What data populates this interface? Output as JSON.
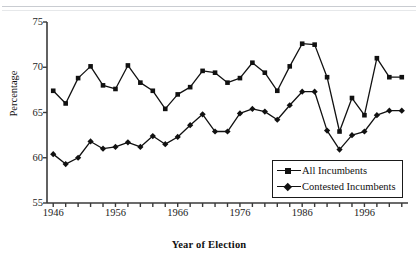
{
  "figure": {
    "background": "#ffffff",
    "line_color": "#111111",
    "axis_color": "#333333"
  },
  "chart_data": {
    "type": "line",
    "title": "",
    "xlabel": "Year of Election",
    "ylabel": "Percentage",
    "xlim": [
      1945,
      2003
    ],
    "ylim": [
      55,
      75
    ],
    "yticks": [
      55,
      60,
      65,
      70,
      75
    ],
    "xticks": [
      1946,
      1956,
      1966,
      1976,
      1986,
      1996
    ],
    "xtick_labels": [
      "1946",
      "1956",
      "1966",
      "1976",
      "1986",
      "1996"
    ],
    "ytick_labels": [
      "55",
      "60",
      "65",
      "70",
      "75"
    ],
    "xminor_tick_step": 2,
    "grid": false,
    "legend_position": "lower right",
    "x": [
      1946,
      1948,
      1950,
      1952,
      1954,
      1956,
      1958,
      1960,
      1962,
      1964,
      1966,
      1968,
      1970,
      1972,
      1974,
      1976,
      1978,
      1980,
      1982,
      1984,
      1986,
      1988,
      1990,
      1992,
      1994,
      1996,
      1998,
      2000,
      2002
    ],
    "series": [
      {
        "name": "All Incumbents",
        "marker": "square",
        "values": [
          67.4,
          66.0,
          68.8,
          70.1,
          68.0,
          67.6,
          70.2,
          68.3,
          67.4,
          65.4,
          67.0,
          67.8,
          69.6,
          69.4,
          68.3,
          68.8,
          70.5,
          69.4,
          67.4,
          70.1,
          72.6,
          72.5,
          68.9,
          62.9,
          66.6,
          64.7,
          71.0,
          68.9,
          68.9
        ]
      },
      {
        "name": "Contested Incumbents",
        "marker": "diamond",
        "values": [
          60.4,
          59.3,
          60.0,
          61.8,
          61.0,
          61.2,
          61.7,
          61.2,
          62.4,
          61.5,
          62.3,
          63.6,
          64.8,
          62.9,
          62.9,
          64.9,
          65.4,
          65.1,
          64.2,
          65.8,
          67.3,
          67.3,
          63.0,
          60.9,
          62.5,
          62.9,
          64.7,
          65.2,
          65.2
        ]
      }
    ]
  },
  "legend": {
    "items": [
      {
        "label": "All Incumbents",
        "marker": "square"
      },
      {
        "label": "Contested Incumbents",
        "marker": "diamond"
      }
    ]
  }
}
